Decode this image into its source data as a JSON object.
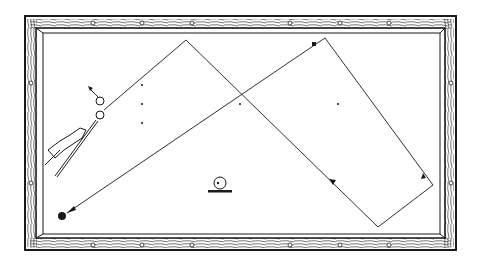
{
  "diagram": {
    "colors": {
      "ink": "#1a1a1a",
      "felt": "#ffffff",
      "rail_wood": "#ffffff"
    },
    "table": {
      "outer": {
        "x": 25,
        "y": 16,
        "w": 431,
        "h": 234
      },
      "inner": {
        "x": 43,
        "y": 33,
        "w": 397,
        "h": 201
      },
      "diamonds_top": [
        94,
        142,
        192,
        290,
        340,
        389
      ],
      "diamonds_bottom": [
        94,
        142,
        192,
        290,
        340,
        389
      ],
      "diamonds_left": [
        83,
        183
      ],
      "diamonds_right": [
        83,
        183
      ]
    },
    "balls": {
      "object_ball": {
        "x": 100,
        "y": 101,
        "r": 4
      },
      "cue_ball": {
        "x": 100,
        "y": 115,
        "r": 4
      },
      "target_ball": {
        "x": 62,
        "y": 216,
        "r": 4
      }
    },
    "paths": {
      "object_ball_path": [
        [
          104,
          110
        ],
        [
          186,
          40
        ],
        [
          378,
          227
        ],
        [
          433,
          185
        ],
        [
          325,
          38
        ],
        [
          316,
          44
        ]
      ],
      "cue_ball_path": [
        [
          316,
          44
        ],
        [
          67,
          213
        ]
      ]
    },
    "markers": {
      "square_marker": {
        "x": 314,
        "y": 44
      },
      "arrow_on_path_1": {
        "x": 333,
        "y": 183
      },
      "arrow_on_path_2": {
        "x": 422,
        "y": 176
      }
    },
    "spot_dots": [
      [
        142,
        85
      ],
      [
        142,
        104
      ],
      [
        142,
        123
      ],
      [
        240,
        104
      ],
      [
        338,
        104
      ]
    ],
    "english_icon": {
      "x": 220,
      "y": 183,
      "label": "cue-ball-english-indicator"
    }
  }
}
